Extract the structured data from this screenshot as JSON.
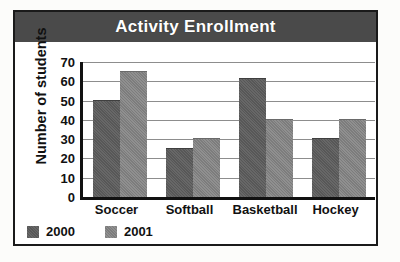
{
  "figure": {
    "title": "Activity Enrollment",
    "title_band_color": "#4a4a4a",
    "frame_color": "#1a1a1a",
    "background_color": "#ffffff"
  },
  "chart_data": {
    "type": "bar",
    "title": "Activity Enrollment",
    "xlabel": "",
    "ylabel": "Number of students",
    "categories": [
      "Soccer",
      "Softball",
      "Basketball",
      "Hockey"
    ],
    "series": [
      {
        "name": "2000",
        "color": "#5c5c5c",
        "values": [
          50,
          25,
          61,
          30
        ]
      },
      {
        "name": "2001",
        "color": "#838383",
        "values": [
          65,
          30,
          40,
          40
        ]
      }
    ],
    "ylim": [
      0,
      70
    ],
    "ytick_step": 10,
    "yticks": [
      70,
      60,
      50,
      40,
      30,
      20,
      10,
      0
    ],
    "grid": true,
    "grid_axis": "y",
    "legend": true,
    "legend_position": "bottom-left",
    "legend_entries": [
      "2000",
      "2001"
    ]
  }
}
